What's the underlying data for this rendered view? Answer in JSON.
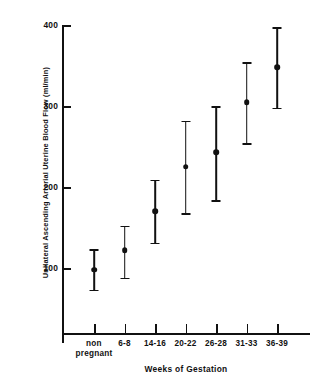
{
  "chart_data": {
    "type": "scatter",
    "title": "",
    "xlabel": "Weeks of Gestation",
    "ylabel": "Unilateral Ascending Arterial Uterine Blood Flow (ml/min)",
    "categories": [
      "non pregnant",
      "6-8",
      "14-16",
      "20-22",
      "26-28",
      "31-33",
      "36-39"
    ],
    "values": [
      98,
      122,
      170,
      225,
      243,
      305,
      348
    ],
    "error_low": [
      73,
      88,
      131,
      168,
      184,
      254,
      298
    ],
    "error_high": [
      123,
      152,
      209,
      282,
      300,
      354,
      397
    ],
    "ylim": [
      0,
      400
    ],
    "yticks": [
      100,
      200,
      300,
      400
    ],
    "ytick_labels": [
      "100",
      "200",
      "300",
      "400"
    ],
    "grid": false,
    "legend": "none",
    "marker": "filled-circle",
    "errorbar_style": "capped-vertical",
    "series_name": "Mean uterine blood flow"
  },
  "xaxis": {
    "tick_labels": [
      [
        "non",
        "pregnant"
      ],
      [
        "6-8"
      ],
      [
        "14-16"
      ],
      [
        "20-22"
      ],
      [
        "26-28"
      ],
      [
        "31-33"
      ],
      [
        "36-39"
      ]
    ]
  }
}
